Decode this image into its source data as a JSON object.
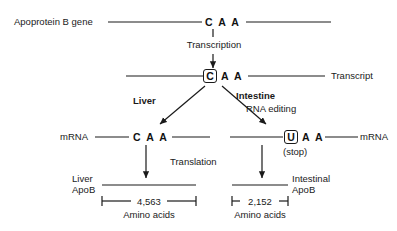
{
  "diagram": {
    "rows": {
      "gene": {
        "left_label": "Apoprotein B gene",
        "codon": "C A A"
      },
      "transcription": {
        "step_label": "Transcription"
      },
      "transcript": {
        "right_label": "Transcript",
        "boxed_base": "C",
        "rest_codon": "A  A"
      },
      "branches": {
        "left_label": "Liver",
        "right_label": "Intestine",
        "right_sublabel": "RNA editing"
      },
      "mrna": {
        "left_label": "mRNA",
        "right_label": "mRNA",
        "left_codon": "C A A",
        "right_boxed_base": "U",
        "right_rest_codon": "A  A",
        "stop_note": "(stop)"
      },
      "translation": {
        "step_label": "Translation"
      },
      "proteins": {
        "left_label_line1": "Liver",
        "left_label_line2": "ApoB",
        "right_label_line1": "Intestinal",
        "right_label_line2": "ApoB"
      },
      "measures": {
        "left_value": "4,563",
        "left_units": "Amino acids",
        "right_value": "2,152",
        "right_units": "Amino acids"
      }
    },
    "colors": {
      "line": "#1a1a1a",
      "text": "#1a1a1a",
      "background": "#ffffff"
    }
  }
}
